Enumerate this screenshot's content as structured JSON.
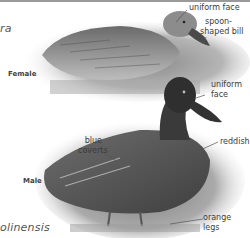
{
  "page": {
    "scientific_name_top_fragment": "ra",
    "scientific_name_bottom_fragment": "olinensis"
  },
  "female": {
    "sex_label": "Female",
    "annotations": [
      {
        "id": "uniform-face",
        "text": "uniform face"
      },
      {
        "id": "bill",
        "line1": "spoon-",
        "line2": "shaped bill"
      }
    ]
  },
  "male": {
    "sex_label": "Male",
    "annotations": [
      {
        "id": "uniform-face",
        "line1": "uniform",
        "line2": "face"
      },
      {
        "id": "blue-coverts",
        "line1": "blue",
        "line2": "coverts"
      },
      {
        "id": "reddish",
        "text": "reddish"
      },
      {
        "id": "orange-legs",
        "line1": "orange",
        "line2": "legs"
      }
    ]
  },
  "colors": {
    "rule": "#9a9a9a",
    "label_text": "#3c3c3c",
    "leader_line": "#555555"
  }
}
